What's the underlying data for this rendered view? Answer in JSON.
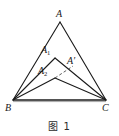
{
  "figure": {
    "caption": "图 1",
    "background_color": "#ffffff",
    "stroke_color": "#1a1a1a",
    "labels": {
      "apex_A": "A",
      "apex_A1_base": "A",
      "apex_A1_sub": "1",
      "apex_A2_base": "A",
      "apex_A2_sub": "2",
      "point_A_prime": "A′",
      "vertex_B": "B",
      "vertex_C": "C"
    }
  },
  "geometry": {
    "points": {
      "A": {
        "x": 60.0,
        "y": 22.0
      },
      "A1": {
        "x": 55.0,
        "y": 58.0
      },
      "A2": {
        "x": 55.0,
        "y": 78.0
      },
      "Aprime": {
        "x": 72.0,
        "y": 68.0
      },
      "B": {
        "x": 13.0,
        "y": 100.0
      },
      "C": {
        "x": 106.0,
        "y": 100.0
      }
    },
    "segments": [
      {
        "name": "side-AB",
        "from": "A",
        "to": "B",
        "style": "solid"
      },
      {
        "name": "side-AC",
        "from": "A",
        "to": "C",
        "style": "solid"
      },
      {
        "name": "side-A1B",
        "from": "A1",
        "to": "B",
        "style": "solid"
      },
      {
        "name": "side-A1C",
        "from": "A1",
        "to": "C",
        "style": "solid"
      },
      {
        "name": "side-A2B",
        "from": "A2",
        "to": "B",
        "style": "solid"
      },
      {
        "name": "side-A2C",
        "from": "A2",
        "to": "C",
        "style": "solid"
      },
      {
        "name": "base-BC",
        "from": "B",
        "to": "C",
        "style": "solid"
      },
      {
        "name": "segment-A2-Aprime",
        "from": "A2",
        "to": "Aprime",
        "style": "dashed"
      }
    ]
  }
}
